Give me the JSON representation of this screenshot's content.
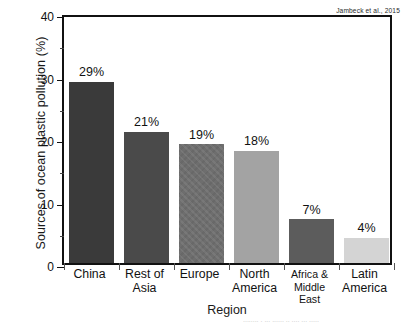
{
  "chart_data": {
    "type": "bar",
    "title": "",
    "xlabel": "Region",
    "ylabel": "Sources of ocean plastic pollution (%)",
    "categories": [
      "China",
      "Rest of Asia",
      "Europe",
      "North America",
      "Africa & Middle East",
      "Latin America"
    ],
    "values": [
      29,
      21,
      19,
      18,
      7,
      4
    ],
    "value_labels": [
      "29%",
      "21%",
      "19%",
      "18%",
      "7%",
      "4%"
    ],
    "ylim": [
      0,
      40
    ],
    "yticks": [
      0,
      10,
      20,
      30,
      40
    ],
    "ytick_labels": [
      "0",
      "10",
      "20",
      "30",
      "40"
    ],
    "yminor_ticks": [
      5,
      15,
      25,
      35
    ],
    "grid": false,
    "legend": null,
    "annotation": "Jambeck et al., 2015",
    "bar_colors": [
      "#3a3a3a",
      "#4a4a4a",
      "#6e6e6e",
      "#a3a3a3",
      "#5c5c5c",
      "#d4d4d4"
    ],
    "bar_textures": [
      "solid",
      "solid",
      "hatch",
      "solid",
      "solid",
      "solid"
    ],
    "frame_color": "#111111",
    "background_color": "#ffffff"
  },
  "axes": {
    "y_title": "Sources of ocean plastic pollution (%)",
    "x_title": "Region"
  },
  "category_label_lines": [
    [
      "China"
    ],
    [
      "Rest of",
      "Asia"
    ],
    [
      "Europe"
    ],
    [
      "North",
      "America"
    ],
    [
      "Africa &",
      "Middle East"
    ],
    [
      "Latin",
      "America"
    ]
  ],
  "artifact": {
    "bottom_text": "........ . ... ...... .. .... ... ....."
  }
}
